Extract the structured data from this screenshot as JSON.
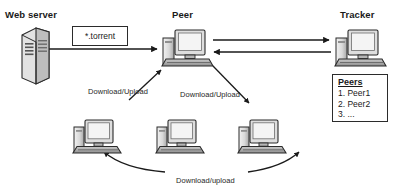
{
  "diagram": {
    "background": "#ffffff",
    "line_color": "#1a1a1a",
    "node_titles": [
      {
        "id": "web-server",
        "label": "Web server",
        "x": 5,
        "y": 9
      },
      {
        "id": "peer",
        "label": "Peer",
        "x": 172,
        "y": 9
      },
      {
        "id": "tracker",
        "label": "Tracker",
        "x": 340,
        "y": 9
      }
    ],
    "torrent_file_box": {
      "label": "*.torrent",
      "x": 72,
      "y": 26,
      "width": 56,
      "height": 20
    },
    "peers_list_box": {
      "title": "Peers",
      "items": [
        "1. Peer1",
        "2. Peer2",
        "3. ..."
      ],
      "x": 332,
      "y": 74,
      "width": 56,
      "height": 48
    },
    "edge_labels": [
      {
        "id": "download-upload-left",
        "label": "Download/Upload",
        "x": 88,
        "y": 87
      },
      {
        "id": "download-upload-right",
        "label": "Download/Upload",
        "x": 180,
        "y": 90
      },
      {
        "id": "download-upload-bottom",
        "label": "Download/upload",
        "x": 176,
        "y": 176
      }
    ],
    "nodes": [
      {
        "id": "web-server-icon",
        "type": "server",
        "x": 22,
        "y": 30
      },
      {
        "id": "peer-computer",
        "type": "computer",
        "x": 163,
        "y": 28
      },
      {
        "id": "tracker-computer",
        "type": "computer",
        "x": 336,
        "y": 28
      },
      {
        "id": "peer-computer-left",
        "type": "computer",
        "x": 73,
        "y": 117
      },
      {
        "id": "peer-computer-center",
        "type": "computer",
        "x": 156,
        "y": 117
      },
      {
        "id": "peer-computer-right",
        "type": "computer",
        "x": 238,
        "y": 117
      }
    ],
    "connections": [
      {
        "id": "webserver-to-peer",
        "from": "web-server",
        "to": "peer",
        "direction": "right"
      },
      {
        "id": "peer-to-tracker",
        "from": "peer",
        "to": "tracker",
        "direction": "right"
      },
      {
        "id": "tracker-to-peer",
        "from": "tracker",
        "to": "peer",
        "direction": "left"
      },
      {
        "id": "peerleft-to-peer",
        "from": "peer-computer-left",
        "to": "peer",
        "direction": "up-right"
      },
      {
        "id": "peer-to-peerright",
        "from": "peer",
        "to": "peer-computer-right",
        "direction": "down-right"
      },
      {
        "id": "peercenter-to-peerleft",
        "from": "peer-computer-center",
        "to": "peer-computer-left",
        "direction": "up-left"
      },
      {
        "id": "peercenter-to-peerright",
        "from": "peer-computer-center",
        "to": "peer-computer-right",
        "direction": "up-right"
      }
    ]
  }
}
